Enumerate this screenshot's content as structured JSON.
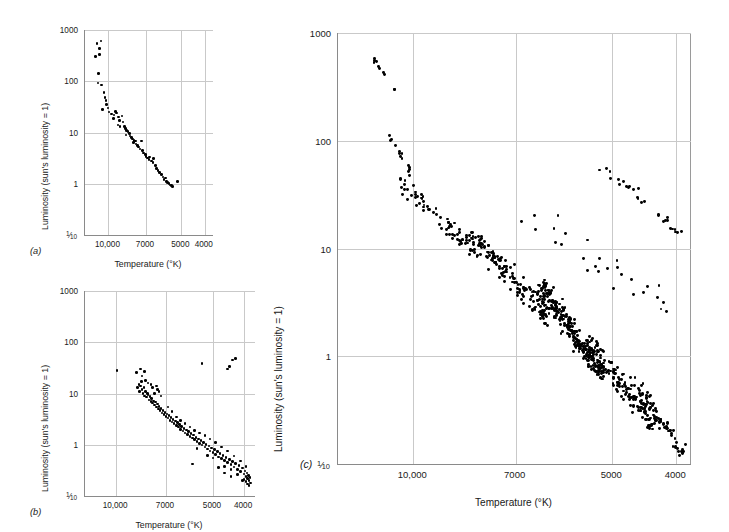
{
  "figure": {
    "axis_title_x": "Temperature (°K)",
    "axis_title_y": "Luminosity (sun's luminosity = 1)",
    "ytick_labels": [
      "1000",
      "100",
      "10",
      "1",
      "1/10"
    ],
    "xtick_labels": [
      "10,000",
      "7000",
      "5000",
      "4000"
    ],
    "colors": {
      "ink": "#000000",
      "grid": "#c9c9c9",
      "frame": "#8a8a8a",
      "background": "#ffffff"
    }
  },
  "panels": [
    {
      "key": "a",
      "label": "(a)",
      "caption_label": "(a)"
    },
    {
      "key": "b",
      "label": "(b)",
      "caption_label": "(b)"
    },
    {
      "key": "c",
      "label": "(c)",
      "caption_label": "(c)"
    }
  ],
  "chart_data": [
    {
      "id": "panel-a",
      "type": "scatter",
      "title": "(a)",
      "xlabel": "Temperature (°K)",
      "ylabel": "Luminosity (sun's luminosity = 1)",
      "x_scale": "log-reversed",
      "y_scale": "log",
      "xlim": [
        12500,
        3700
      ],
      "ylim": [
        0.1,
        1000
      ],
      "xticks": [
        10000,
        7000,
        5000,
        4000
      ],
      "xtick_labels": [
        "10,000",
        "7000",
        "5000",
        "4000"
      ],
      "yticks": [
        1000,
        100,
        10,
        1,
        0.1
      ],
      "ytick_labels": [
        "1000",
        "100",
        "10",
        "1",
        "1/10"
      ],
      "grid": true,
      "n_points": 68,
      "points": [
        [
          11150,
          540
        ],
        [
          10750,
          610
        ],
        [
          10900,
          430
        ],
        [
          11300,
          300
        ],
        [
          10900,
          330
        ],
        [
          11000,
          140
        ],
        [
          11050,
          92
        ],
        [
          10700,
          85
        ],
        [
          10450,
          60
        ],
        [
          10350,
          48
        ],
        [
          10250,
          42
        ],
        [
          10200,
          35
        ],
        [
          10050,
          30
        ],
        [
          10600,
          28
        ],
        [
          9950,
          25
        ],
        [
          9700,
          23
        ],
        [
          9500,
          22
        ],
        [
          9350,
          26
        ],
        [
          9250,
          24
        ],
        [
          9550,
          19
        ],
        [
          9100,
          20
        ],
        [
          9000,
          17
        ],
        [
          9150,
          14
        ],
        [
          8950,
          13
        ],
        [
          8800,
          21
        ],
        [
          8700,
          16
        ],
        [
          8600,
          13
        ],
        [
          8500,
          12
        ],
        [
          8400,
          11
        ],
        [
          8300,
          10.5
        ],
        [
          8200,
          9.5
        ],
        [
          8450,
          9
        ],
        [
          8150,
          8.6
        ],
        [
          8050,
          8
        ],
        [
          7950,
          7.5
        ],
        [
          7850,
          7
        ],
        [
          7750,
          6.8
        ],
        [
          7900,
          6.3
        ],
        [
          7700,
          6
        ],
        [
          7600,
          5.6
        ],
        [
          7500,
          5.2
        ],
        [
          7400,
          4.8
        ],
        [
          7300,
          6.8
        ],
        [
          7250,
          4.4
        ],
        [
          7150,
          4
        ],
        [
          7050,
          3.7
        ],
        [
          7000,
          3.4
        ],
        [
          6900,
          3.2
        ],
        [
          6800,
          3
        ],
        [
          6750,
          3.3
        ],
        [
          6650,
          2.8
        ],
        [
          6550,
          2.6
        ],
        [
          6500,
          3.1
        ],
        [
          6400,
          2.3
        ],
        [
          6350,
          2
        ],
        [
          6250,
          1.8
        ],
        [
          6150,
          1.65
        ],
        [
          6050,
          1.5
        ],
        [
          5950,
          1.35
        ],
        [
          5900,
          1.2
        ],
        [
          5800,
          1.3
        ],
        [
          5750,
          1.1
        ],
        [
          5700,
          1.05
        ],
        [
          5620,
          1
        ],
        [
          5560,
          0.95
        ],
        [
          5500,
          0.92
        ],
        [
          5450,
          0.88
        ],
        [
          5200,
          1.1
        ]
      ]
    },
    {
      "id": "panel-b",
      "type": "scatter",
      "title": "(b)",
      "xlabel": "Temperature (°K)",
      "ylabel": "Luminosity (sun's luminosity = 1)",
      "x_scale": "log-reversed",
      "y_scale": "log",
      "xlim": [
        12500,
        3700
      ],
      "ylim": [
        0.1,
        1000
      ],
      "xticks": [
        10000,
        7000,
        5000,
        4000
      ],
      "xtick_labels": [
        "10,000",
        "7000",
        "5000",
        "4000"
      ],
      "yticks": [
        1000,
        100,
        10,
        1,
        0.1
      ],
      "ytick_labels": [
        "1000",
        "100",
        "10",
        "1",
        "1/10"
      ],
      "grid": true,
      "n_points": 140,
      "giant_points": [
        [
          9950,
          28
        ],
        [
          8650,
          26
        ],
        [
          8400,
          30
        ],
        [
          8300,
          22
        ],
        [
          8150,
          27
        ],
        [
          5400,
          38
        ],
        [
          4450,
          34
        ],
        [
          4350,
          45
        ],
        [
          4250,
          48
        ],
        [
          4500,
          30
        ]
      ],
      "points": [
        [
          8600,
          13
        ],
        [
          8500,
          15
        ],
        [
          8450,
          11
        ],
        [
          8400,
          14
        ],
        [
          8350,
          17
        ],
        [
          8300,
          12
        ],
        [
          8250,
          10
        ],
        [
          8200,
          13
        ],
        [
          8150,
          9
        ],
        [
          8100,
          11
        ],
        [
          8050,
          8.5
        ],
        [
          8000,
          10
        ],
        [
          7950,
          9.5
        ],
        [
          7900,
          7.5
        ],
        [
          7850,
          8.8
        ],
        [
          7800,
          7
        ],
        [
          7750,
          8
        ],
        [
          7700,
          6.5
        ],
        [
          7650,
          7.2
        ],
        [
          7600,
          6
        ],
        [
          7550,
          6.8
        ],
        [
          7500,
          5.5
        ],
        [
          7450,
          6.2
        ],
        [
          7400,
          5
        ],
        [
          7350,
          5.6
        ],
        [
          7300,
          4.6
        ],
        [
          7250,
          5.1
        ],
        [
          7200,
          4.2
        ],
        [
          7150,
          4.7
        ],
        [
          7100,
          3.9
        ],
        [
          7050,
          4.3
        ],
        [
          7000,
          3.6
        ],
        [
          6950,
          4
        ],
        [
          6900,
          3.3
        ],
        [
          6850,
          3.7
        ],
        [
          6800,
          3
        ],
        [
          6750,
          3.4
        ],
        [
          6700,
          2.8
        ],
        [
          6650,
          3.1
        ],
        [
          6600,
          2.6
        ],
        [
          6550,
          2.9
        ],
        [
          6500,
          2.4
        ],
        [
          6450,
          2.7
        ],
        [
          6400,
          2.2
        ],
        [
          6350,
          2.5
        ],
        [
          6300,
          2
        ],
        [
          6250,
          2.3
        ],
        [
          6200,
          1.85
        ],
        [
          6150,
          2.1
        ],
        [
          6100,
          1.7
        ],
        [
          6050,
          1.95
        ],
        [
          6000,
          1.6
        ],
        [
          5950,
          1.8
        ],
        [
          5900,
          1.45
        ],
        [
          5850,
          1.65
        ],
        [
          5800,
          1.35
        ],
        [
          5750,
          1.55
        ],
        [
          5700,
          1.25
        ],
        [
          5650,
          1.4
        ],
        [
          5600,
          1.15
        ],
        [
          5550,
          1.3
        ],
        [
          5500,
          1.05
        ],
        [
          5450,
          1.2
        ],
        [
          5400,
          0.98
        ],
        [
          5350,
          1.1
        ],
        [
          5300,
          0.9
        ],
        [
          5250,
          1
        ],
        [
          5200,
          0.82
        ],
        [
          5150,
          0.94
        ],
        [
          5100,
          0.76
        ],
        [
          5050,
          0.86
        ],
        [
          5000,
          0.7
        ],
        [
          4950,
          0.8
        ],
        [
          4900,
          0.64
        ],
        [
          4850,
          0.73
        ],
        [
          4800,
          0.58
        ],
        [
          4750,
          0.67
        ],
        [
          4700,
          0.54
        ],
        [
          4650,
          0.61
        ],
        [
          4600,
          0.49
        ],
        [
          4550,
          0.56
        ],
        [
          4500,
          0.45
        ],
        [
          4450,
          0.51
        ],
        [
          4400,
          0.41
        ],
        [
          4350,
          0.47
        ],
        [
          4300,
          0.37
        ],
        [
          4250,
          0.43
        ],
        [
          4200,
          0.33
        ],
        [
          4150,
          0.39
        ],
        [
          4100,
          0.3
        ],
        [
          4050,
          0.35
        ],
        [
          4000,
          0.27
        ],
        [
          3980,
          0.31
        ],
        [
          3950,
          0.24
        ],
        [
          3920,
          0.28
        ],
        [
          3900,
          0.22
        ],
        [
          3880,
          0.25
        ],
        [
          3860,
          0.2
        ],
        [
          3840,
          0.23
        ],
        [
          3820,
          0.18
        ],
        [
          7450,
          12
        ],
        [
          7350,
          11
        ],
        [
          7250,
          9
        ],
        [
          7500,
          14
        ],
        [
          6900,
          5.5
        ],
        [
          6700,
          4.5
        ],
        [
          6500,
          3.5
        ],
        [
          6300,
          3
        ],
        [
          6100,
          2.6
        ],
        [
          5900,
          2.2
        ],
        [
          5700,
          1.9
        ],
        [
          5500,
          1.7
        ],
        [
          5300,
          1.5
        ],
        [
          5100,
          1.3
        ],
        [
          4900,
          1.1
        ],
        [
          4700,
          0.9
        ],
        [
          4500,
          0.75
        ],
        [
          4300,
          0.6
        ],
        [
          4100,
          0.48
        ],
        [
          3950,
          0.38
        ],
        [
          5800,
          0.42
        ],
        [
          5000,
          0.55
        ],
        [
          4400,
          0.33
        ],
        [
          4600,
          0.38
        ],
        [
          4200,
          0.26
        ],
        [
          8100,
          18
        ],
        [
          7950,
          16
        ],
        [
          7700,
          13
        ],
        [
          7600,
          10
        ],
        [
          7800,
          15
        ],
        [
          4050,
          0.2
        ],
        [
          3900,
          0.17
        ],
        [
          3860,
          0.16
        ],
        [
          3950,
          0.19
        ],
        [
          4000,
          0.21
        ],
        [
          4600,
          0.28
        ],
        [
          4400,
          0.24
        ],
        [
          4800,
          0.36
        ],
        [
          5200,
          0.62
        ],
        [
          5600,
          0.85
        ]
      ]
    },
    {
      "id": "panel-c",
      "type": "scatter",
      "title": "(c)",
      "xlabel": "Temperature (°K)",
      "ylabel": "Luminosity (sun's luminosity = 1)",
      "x_scale": "log-reversed",
      "y_scale": "log",
      "xlim": [
        13000,
        3800
      ],
      "ylim": [
        0.1,
        1000
      ],
      "xticks": [
        10000,
        7000,
        5000,
        4000
      ],
      "xtick_labels": [
        "10,000",
        "7000",
        "5000",
        "4000"
      ],
      "yticks": [
        1000,
        100,
        10,
        1,
        0.1
      ],
      "ytick_labels": [
        "1000",
        "100",
        "10",
        "1",
        "1/10"
      ],
      "grid": true,
      "n_points": 760,
      "description": "Full Hertzsprung-Russell diagram: main sequence from hot luminous stars down to cool faint dwarfs, plus a red giant branch at 4000-5000 K.",
      "seed": 20231,
      "clusters": [
        {
          "name": "bright-blue-upper",
          "n": 10,
          "x_range": [
            11600,
            10600
          ],
          "y_range": [
            280,
            620
          ],
          "spread": 0.25
        },
        {
          "name": "upper-main-sequence",
          "n": 14,
          "x_range": [
            11200,
            10000
          ],
          "y_range": [
            45,
            150
          ],
          "spread": 0.3
        },
        {
          "name": "main-sequence-upper",
          "n": 70,
          "x_range": [
            10400,
            8000
          ],
          "y_range": [
            9,
            40
          ],
          "spread": 0.38
        },
        {
          "name": "main-sequence-mid",
          "n": 150,
          "x_range": [
            8200,
            6200
          ],
          "y_range": [
            2.2,
            14
          ],
          "spread": 0.4
        },
        {
          "name": "main-sequence-core",
          "n": 250,
          "x_range": [
            6400,
            5200
          ],
          "y_range": [
            0.7,
            4.5
          ],
          "spread": 0.42
        },
        {
          "name": "main-sequence-lower",
          "n": 150,
          "x_range": [
            5400,
            4300
          ],
          "y_range": [
            0.22,
            1.3
          ],
          "spread": 0.42
        },
        {
          "name": "main-sequence-faint",
          "n": 70,
          "x_range": [
            4600,
            3900
          ],
          "y_range": [
            0.12,
            0.55
          ],
          "spread": 0.4
        },
        {
          "name": "giant-branch",
          "n": 28,
          "x_range": [
            5200,
            3950
          ],
          "y_range": [
            14,
            60
          ],
          "spread": 0.35
        },
        {
          "name": "scattered-subgiants",
          "n": 28,
          "x_range": [
            7000,
            4200
          ],
          "y_range": [
            3,
            25
          ],
          "spread": 0.5
        }
      ]
    }
  ]
}
